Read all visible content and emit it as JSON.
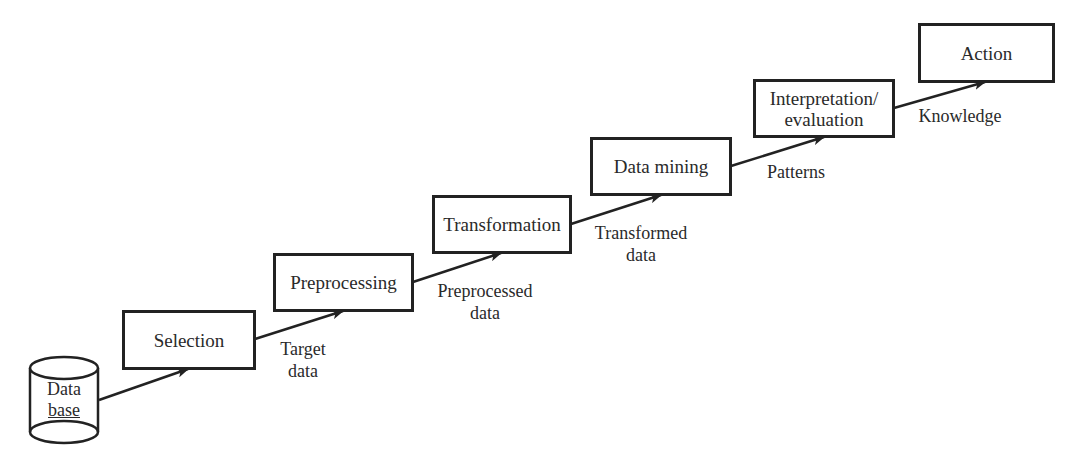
{
  "diagram": {
    "type": "process-flow",
    "source": {
      "line1": "Data",
      "line2": "base"
    },
    "stages": [
      {
        "id": "selection",
        "label": "Selection"
      },
      {
        "id": "preprocessing",
        "label": "Preprocessing"
      },
      {
        "id": "transformation",
        "label": "Transformation"
      },
      {
        "id": "data-mining",
        "label": "Data mining"
      },
      {
        "id": "interpretation",
        "label_line1": "Interpretation/",
        "label_line2": "evaluation"
      },
      {
        "id": "action",
        "label": "Action"
      }
    ],
    "edge_labels": [
      {
        "line1": "Target",
        "line2": "data"
      },
      {
        "line1": "Preprocessed",
        "line2": "data"
      },
      {
        "line1": "Transformed",
        "line2": "data"
      },
      {
        "line1": "Patterns"
      },
      {
        "line1": "Knowledge"
      }
    ],
    "edges": [
      {
        "from": "database",
        "to": "selection"
      },
      {
        "from": "selection",
        "to": "preprocessing",
        "label_index": 0
      },
      {
        "from": "preprocessing",
        "to": "transformation",
        "label_index": 1
      },
      {
        "from": "transformation",
        "to": "data-mining",
        "label_index": 2
      },
      {
        "from": "data-mining",
        "to": "interpretation",
        "label_index": 3
      },
      {
        "from": "interpretation",
        "to": "action",
        "label_index": 4
      }
    ]
  }
}
